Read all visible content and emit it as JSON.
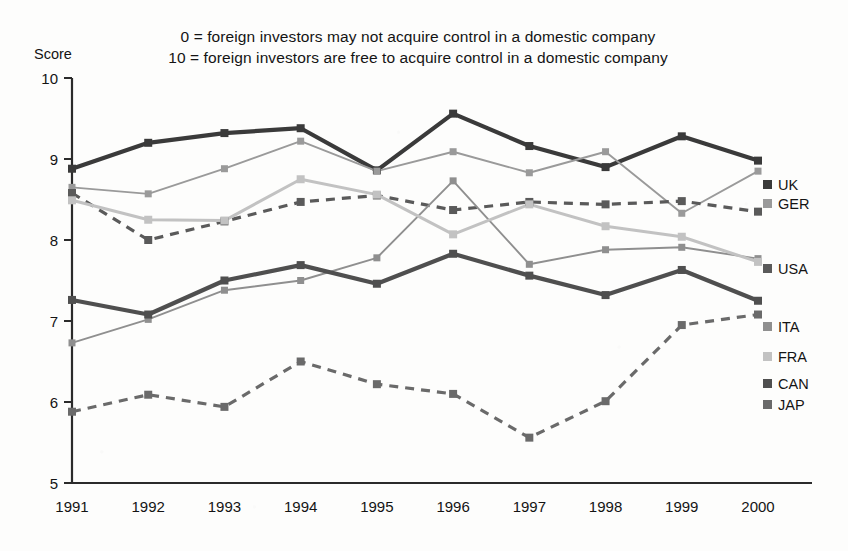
{
  "caption": {
    "line1": "0 = foreign investors may not acquire control in a domestic company",
    "line2": "10 = foreign investors are free to acquire control in a domestic company"
  },
  "axis": {
    "y_title": "Score",
    "y_ticks": [
      "10",
      "9",
      "8",
      "7",
      "6",
      "5"
    ],
    "x_ticks": [
      "1991",
      "1992",
      "1993",
      "1994",
      "1995",
      "1996",
      "1997",
      "1998",
      "1999",
      "2000"
    ]
  },
  "series_labels": {
    "uk": "UK",
    "ger": "GER",
    "usa": "USA",
    "ita": "ITA",
    "fra": "FRA",
    "can": "CAN",
    "jap": "JAP"
  },
  "colors": {
    "uk": "#3a3a3a",
    "ger": "#9a9a9a",
    "usa": "#5a5a5a",
    "ita": "#8f8f8f",
    "fra": "#c2c2c2",
    "can": "#4f4f4f",
    "jap": "#6a6a6a",
    "axis": "#2b2b2b",
    "background": "#fdfdfc"
  },
  "chart_data": {
    "type": "line",
    "xlabel": "",
    "ylabel": "Score",
    "ylim": [
      5,
      10
    ],
    "ytick_values": [
      5,
      6,
      7,
      8,
      9,
      10
    ],
    "grid": false,
    "legend_position": "right-inline",
    "x": [
      "1991",
      "1992",
      "1993",
      "1994",
      "1995",
      "1996",
      "1997",
      "1998",
      "1999",
      "2000"
    ],
    "series": [
      {
        "name": "UK",
        "style": "solid-thick",
        "color": "#3a3a3a",
        "values": [
          8.88,
          9.2,
          9.32,
          9.38,
          8.86,
          9.56,
          9.16,
          8.9,
          9.28,
          8.98
        ]
      },
      {
        "name": "GER",
        "style": "solid-thin",
        "color": "#9a9a9a",
        "values": [
          8.65,
          8.57,
          8.88,
          9.22,
          8.85,
          9.09,
          8.83,
          9.09,
          8.33,
          8.85
        ]
      },
      {
        "name": "USA",
        "style": "dashed",
        "color": "#5a5a5a",
        "values": [
          8.58,
          8.0,
          8.23,
          8.47,
          8.55,
          8.37,
          8.47,
          8.44,
          8.48,
          8.35
        ]
      },
      {
        "name": "ITA",
        "style": "solid-thin",
        "color": "#8f8f8f",
        "values": [
          6.73,
          7.02,
          7.38,
          7.5,
          7.78,
          8.73,
          7.7,
          7.88,
          7.91,
          7.77
        ]
      },
      {
        "name": "FRA",
        "style": "solid-medium",
        "color": "#c2c2c2",
        "values": [
          8.49,
          8.25,
          8.24,
          8.75,
          8.56,
          8.07,
          8.44,
          8.17,
          8.04,
          7.73
        ]
      },
      {
        "name": "CAN",
        "style": "solid-thick",
        "color": "#4f4f4f",
        "values": [
          7.26,
          7.08,
          7.5,
          7.69,
          7.46,
          7.83,
          7.56,
          7.32,
          7.63,
          7.25
        ]
      },
      {
        "name": "JAP",
        "style": "dashed",
        "color": "#6a6a6a",
        "values": [
          5.88,
          6.09,
          5.94,
          6.5,
          6.22,
          6.1,
          5.56,
          6.01,
          6.95,
          7.08
        ]
      }
    ]
  }
}
